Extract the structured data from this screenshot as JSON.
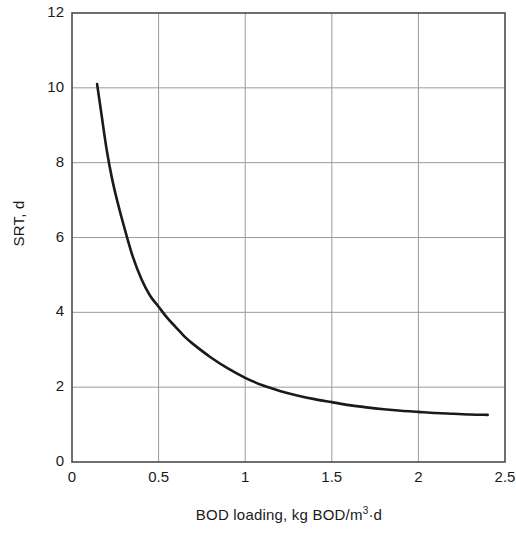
{
  "chart_data": {
    "type": "line",
    "title": "",
    "xlabel": "BOD loading, kg BOD/m3·d",
    "xlabel_base": "BOD loading, kg BOD/m",
    "xlabel_sup": "3",
    "xlabel_tail": "·d",
    "ylabel": "SRT, d",
    "xlim": [
      0,
      2.5
    ],
    "ylim": [
      0,
      12
    ],
    "xticks": [
      "0",
      "0.5",
      "1",
      "1.5",
      "2",
      "2.5"
    ],
    "xtick_values": [
      0,
      0.5,
      1,
      1.5,
      2,
      2.5
    ],
    "yticks": [
      "0",
      "2",
      "4",
      "6",
      "8",
      "10",
      "12"
    ],
    "ytick_values": [
      0,
      2,
      4,
      6,
      8,
      10,
      12
    ],
    "grid": true,
    "grid_color": "#9a9a9a",
    "axis_color": "#4a4a4a",
    "line_color": "#1a1a1a",
    "legend": null,
    "series": [
      {
        "name": "SRT vs BOD loading",
        "x": [
          0.145,
          0.17,
          0.2,
          0.23,
          0.26,
          0.3,
          0.35,
          0.4,
          0.45,
          0.5,
          0.55,
          0.6,
          0.65,
          0.7,
          0.8,
          0.9,
          1.0,
          1.1,
          1.2,
          1.3,
          1.4,
          1.5,
          1.6,
          1.7,
          1.8,
          1.9,
          2.0,
          2.1,
          2.2,
          2.3,
          2.4
        ],
        "y": [
          10.1,
          9.3,
          8.35,
          7.6,
          7.0,
          6.3,
          5.5,
          4.9,
          4.45,
          4.15,
          3.85,
          3.6,
          3.35,
          3.15,
          2.8,
          2.5,
          2.25,
          2.05,
          1.9,
          1.78,
          1.68,
          1.6,
          1.52,
          1.46,
          1.41,
          1.37,
          1.34,
          1.31,
          1.29,
          1.27,
          1.26
        ]
      }
    ]
  }
}
